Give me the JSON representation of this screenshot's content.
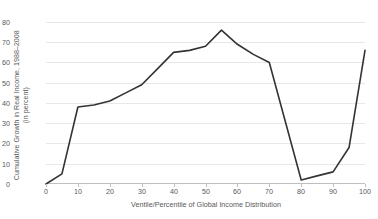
{
  "chart_data": {
    "type": "line",
    "title": "",
    "xlabel": "Ventile/Percentile of Global Income Distribution",
    "ylabel_line1": "Cumulative Growth in Real Income, 1988–2008",
    "ylabel_line2": "(in percent)",
    "xlim": [
      0,
      100
    ],
    "ylim": [
      0,
      80
    ],
    "xticks": [
      "0",
      "10",
      "20",
      "30",
      "40",
      "50",
      "60",
      "70",
      "80",
      "90",
      "100"
    ],
    "yticks": [
      "0",
      "10",
      "20",
      "30",
      "40",
      "50",
      "60",
      "70",
      "80"
    ],
    "grid": "horizontal",
    "legend": "none",
    "line_color": "#333333",
    "line_width": 1.6,
    "series": [
      {
        "name": "Cumulative real income growth 1988-2008",
        "x": [
          0,
          5,
          10,
          15,
          20,
          25,
          30,
          35,
          40,
          45,
          50,
          55,
          60,
          65,
          70,
          75,
          80,
          85,
          90,
          95,
          100
        ],
        "values": [
          0,
          5,
          38,
          39,
          41,
          45,
          49,
          57,
          65,
          66,
          68,
          76,
          69,
          64,
          60,
          31,
          2,
          4,
          6,
          18,
          66
        ]
      }
    ]
  }
}
